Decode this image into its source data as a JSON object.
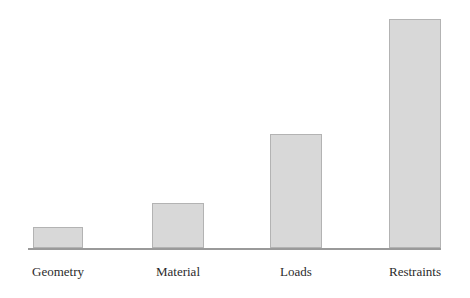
{
  "chart_data": {
    "type": "bar",
    "title": "",
    "subtitle": "",
    "xlabel": "",
    "ylabel": "",
    "categories": [
      "Geometry",
      "Material",
      "Loads",
      "Restraints"
    ],
    "values": [
      21,
      45,
      114,
      229
    ],
    "ylim": [
      0,
      240
    ],
    "grid": false,
    "legend": null,
    "annotations": [],
    "axis_tick_labels": [
      "Geometry",
      "Material",
      "Loads",
      "Restraints"
    ],
    "value_labels_shown": false,
    "y_axis_shown": false,
    "x_axis_shown": true,
    "orientation": "vertical",
    "series": [
      {
        "name": "",
        "values": [
          21,
          45,
          114,
          229
        ]
      }
    ]
  },
  "style": {
    "bar_fill": "#d8d8d8",
    "bar_border": "#b3b3b3",
    "axis_color": "#9a9a9a",
    "label_color": "#2b2b2b",
    "background": "#ffffff"
  },
  "geometry": {
    "baseline_y": 248,
    "axis_left": 28,
    "axis_right": 441,
    "bars": [
      {
        "left": 33,
        "width": 50,
        "top": 227,
        "height": 21,
        "center": 58
      },
      {
        "left": 152,
        "width": 52,
        "top": 203,
        "height": 45,
        "center": 178
      },
      {
        "left": 270,
        "width": 52,
        "top": 134,
        "height": 114,
        "center": 296
      },
      {
        "left": 389,
        "width": 52,
        "top": 19,
        "height": 229,
        "center": 415
      }
    ],
    "label_y": 264
  }
}
